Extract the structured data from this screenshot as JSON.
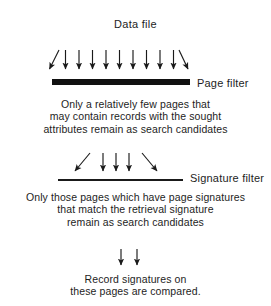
{
  "diagram": {
    "type": "flow-diagram",
    "background_color": "#ffffff",
    "ink_color": "#1a1a1a",
    "title": "Data file",
    "stages": [
      {
        "id": "page-filter",
        "label": "Page filter",
        "arrow_count": 11,
        "arrow_pattern": "diagonal-left, 9 vertical, diagonal-right",
        "filter_style": "thick-solid-bar",
        "caption": "Only a relatively few pages that\nmay contain records with the sought\nattributes remain as search candidates"
      },
      {
        "id": "signature-filter",
        "label": "Signature filter",
        "arrow_count": 5,
        "arrow_pattern": "diagonal-left, 3 vertical, diagonal-right",
        "filter_style": "thin-line",
        "caption": "Only those pages which have page signatures\nthat match the retrieval signature\nremain as search candidates"
      },
      {
        "id": "record-compare",
        "label": "",
        "arrow_count": 2,
        "arrow_pattern": "2 vertical",
        "filter_style": "none",
        "caption": "Record signatures on\nthese pages are compared."
      }
    ],
    "captions": {
      "page_filter_result": "Only a relatively few pages that\nmay contain records with the sought\nattributes remain as search candidates",
      "signature_filter_result": "Only those pages which have page signatures\nthat match the retrieval signature\nremain as search candidates",
      "final_step": "Record signatures on\nthese pages are compared."
    },
    "labels": {
      "data_file": "Data file",
      "page_filter": "Page filter",
      "signature_filter": "Signature filter"
    }
  }
}
